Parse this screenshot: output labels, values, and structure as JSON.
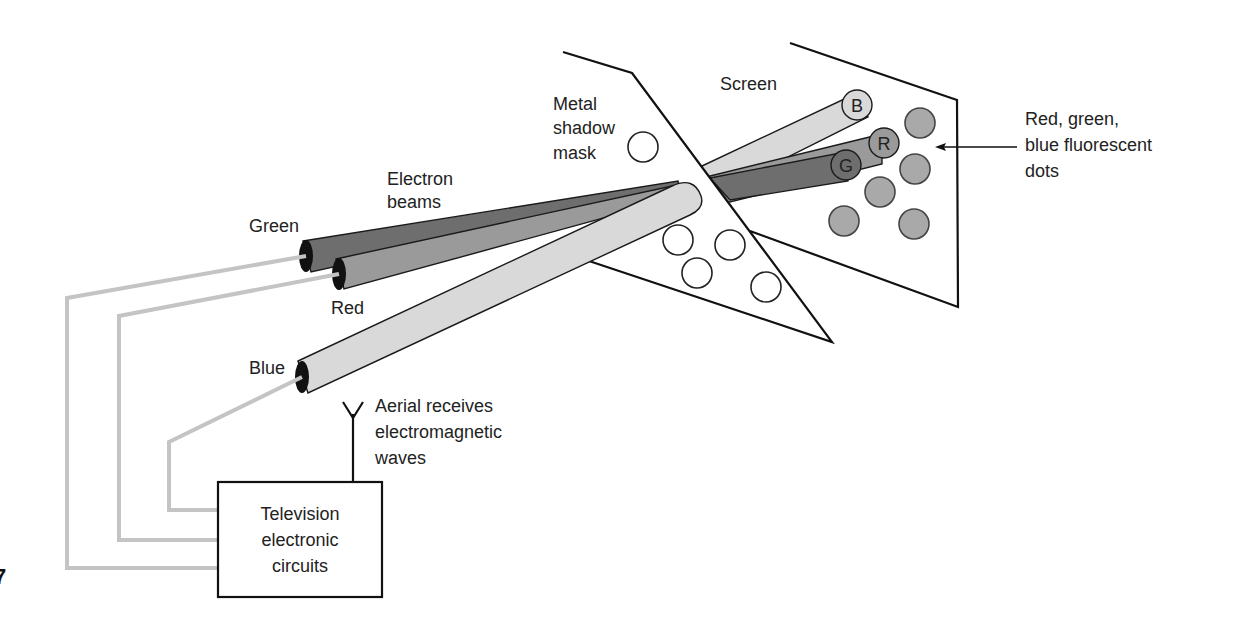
{
  "figure": {
    "number_fragment": "7",
    "colors": {
      "green_beam": "#6e6e6e",
      "red_beam": "#9a9a9a",
      "blue_beam": "#d9d9d9",
      "phosphor_dot": "#a9a9a9",
      "wire": "#c4c4c4",
      "outline": "#111111"
    }
  },
  "labels": {
    "electron_beams": [
      "Electron",
      "beams"
    ],
    "shadow_mask": [
      "Metal",
      "shadow",
      "mask"
    ],
    "screen": "Screen",
    "dots": [
      "Red, green,",
      "blue fluorescent",
      "dots"
    ],
    "aerial": [
      "Aerial receives",
      "electromagnetic",
      "waves"
    ],
    "circuits": [
      "Television",
      "electronic",
      "circuits"
    ]
  },
  "guns": [
    {
      "name": "Green",
      "label": "Green"
    },
    {
      "name": "Red",
      "label": "Red"
    },
    {
      "name": "Blue",
      "label": "Blue"
    }
  ],
  "beam_tips": [
    {
      "letter": "B",
      "beam": "blue"
    },
    {
      "letter": "R",
      "beam": "red"
    },
    {
      "letter": "G",
      "beam": "green"
    }
  ]
}
